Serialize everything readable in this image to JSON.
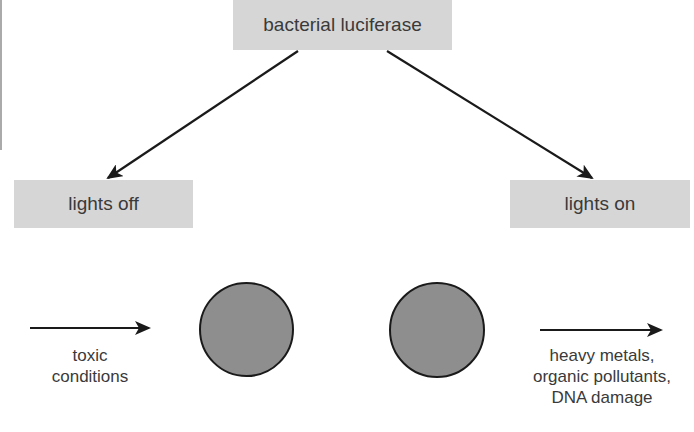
{
  "diagram": {
    "top_node": {
      "label": "bacterial luciferase"
    },
    "left_node": {
      "label": "lights off"
    },
    "right_node": {
      "label": "lights on"
    },
    "left_cell": {
      "shape": "circle"
    },
    "right_cell": {
      "shape": "circle"
    },
    "left_input": {
      "lines": [
        "toxic",
        "conditions"
      ]
    },
    "right_input": {
      "lines": [
        "heavy metals,",
        "organic pollutants,",
        "DNA damage"
      ]
    },
    "colors": {
      "box_fill": "#d6d6d6",
      "circle_fill": "#8e8e8e",
      "stroke": "#1a1a1a",
      "text": "#3a3a3a"
    }
  }
}
